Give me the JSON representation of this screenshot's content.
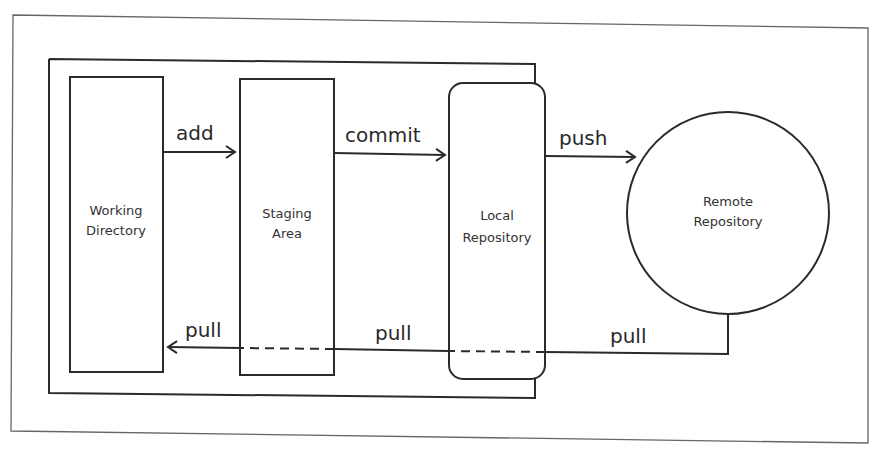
{
  "diagram": {
    "colors": {
      "stroke": "#2a2a2a",
      "frame": "#666666",
      "background": "#ffffff"
    },
    "nodes": {
      "working_directory": {
        "line1": "Working",
        "line2": "Directory"
      },
      "staging_area": {
        "line1": "Staging",
        "line2": "Area"
      },
      "local_repository": {
        "line1": "Local",
        "line2": "Repository"
      },
      "remote_repository": {
        "line1": "Remote",
        "line2": "Repository"
      }
    },
    "edges": {
      "add": "add",
      "commit": "commit",
      "push": "push",
      "pull_left": "pull",
      "pull_middle": "pull",
      "pull_right": "pull"
    }
  }
}
